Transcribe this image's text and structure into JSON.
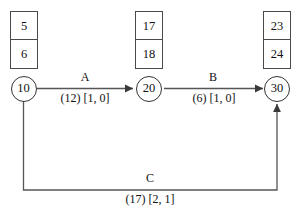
{
  "diagram": {
    "type": "activity-on-arrow-network",
    "nodes": [
      {
        "id": "10",
        "label": "10",
        "early_time": "5",
        "late_time": "6"
      },
      {
        "id": "20",
        "label": "20",
        "early_time": "17",
        "late_time": "18"
      },
      {
        "id": "30",
        "label": "30",
        "early_time": "23",
        "late_time": "24"
      }
    ],
    "edges": [
      {
        "name": "A",
        "from": "10",
        "to": "20",
        "duration": "(12)",
        "floats": "[1, 0]",
        "detail": "(12) [1, 0]"
      },
      {
        "name": "B",
        "from": "20",
        "to": "30",
        "duration": "(6)",
        "floats": "[1, 0]",
        "detail": "(6) [1, 0]"
      },
      {
        "name": "C",
        "from": "10",
        "to": "30",
        "duration": "(17)",
        "floats": "[2, 1]",
        "detail": "(17) [2, 1]"
      }
    ],
    "colors": {
      "line": "#555555",
      "box_border": "#4a4a4a",
      "circle_border": "#333333",
      "text": "#111111",
      "background": "#ffffff"
    }
  }
}
